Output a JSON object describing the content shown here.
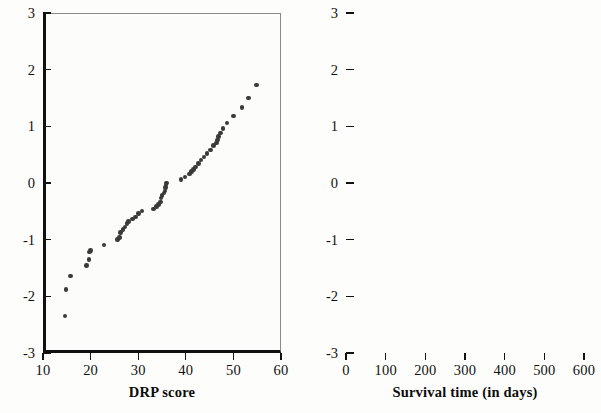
{
  "figure": {
    "background_color": "#fdfdfc",
    "point_color": "#3a3a3a",
    "axis_color": "#111111",
    "panel_count": 2
  },
  "chart_data": [
    {
      "type": "scatter",
      "title": "",
      "xlabel": "DRP score",
      "ylabel": "",
      "xlim": [
        10,
        60
      ],
      "ylim": [
        -3,
        3
      ],
      "xticks": [
        10,
        20,
        30,
        40,
        50,
        60
      ],
      "xticklabels": [
        "10",
        "20",
        "30",
        "40",
        "50",
        "60"
      ],
      "yticks": [
        -3,
        -2,
        -1,
        0,
        1,
        2,
        3
      ],
      "yticklabels": [
        "-3",
        "-2",
        "-1",
        "0",
        "1",
        "2",
        "3"
      ],
      "grid": false,
      "legend": "none",
      "x": [
        14.0,
        14.2,
        15.2,
        18.5,
        19.0,
        19.2,
        19.4,
        22.2,
        25.0,
        25.4,
        25.6,
        26.2,
        26.6,
        27.0,
        27.3,
        28.2,
        28.8,
        29.4,
        30.2,
        32.6,
        33.2,
        33.6,
        34.0,
        34.2,
        34.4,
        34.8,
        35.0,
        35.1,
        35.2,
        35.3,
        38.4,
        39.2,
        40.2,
        40.6,
        41.0,
        41.4,
        42.0,
        42.6,
        43.2,
        43.8,
        44.6,
        45.2,
        45.8,
        46.0,
        46.2,
        46.6,
        47.2,
        48.0,
        49.4,
        51.2,
        52.6,
        54.2
      ],
      "y": [
        -2.33,
        -1.86,
        -1.62,
        -1.44,
        -1.33,
        -1.2,
        -1.17,
        -1.08,
        -0.98,
        -0.94,
        -0.86,
        -0.8,
        -0.76,
        -0.7,
        -0.66,
        -0.62,
        -0.58,
        -0.52,
        -0.48,
        -0.44,
        -0.4,
        -0.36,
        -0.32,
        -0.25,
        -0.2,
        -0.16,
        -0.12,
        -0.06,
        -0.02,
        0.02,
        0.08,
        0.12,
        0.18,
        0.22,
        0.26,
        0.3,
        0.36,
        0.42,
        0.48,
        0.54,
        0.6,
        0.68,
        0.72,
        0.78,
        0.84,
        0.9,
        0.98,
        1.08,
        1.2,
        1.35,
        1.52,
        1.75,
        2.21
      ]
    },
    {
      "type": "scatter",
      "title": "",
      "xlabel": "Survival time (in days)",
      "ylabel": "",
      "xlim": [
        0,
        600
      ],
      "ylim": [
        -3,
        3
      ],
      "xticks": [
        0,
        100,
        200,
        300,
        400,
        500,
        600
      ],
      "xticklabels": [
        "0",
        "100",
        "200",
        "300",
        "400",
        "500",
        "600"
      ],
      "yticks": [
        -3,
        -2,
        -1,
        0,
        1,
        2,
        3
      ],
      "yticklabels": [
        "-3",
        "-2",
        "-1",
        "0",
        "1",
        "2",
        "3"
      ],
      "grid": false,
      "legend": "none",
      "x": [
        45,
        47,
        53,
        56,
        58,
        60,
        62,
        66,
        68,
        69,
        70,
        72,
        74,
        75,
        76,
        77,
        78,
        79,
        80,
        81,
        82,
        83,
        84,
        85,
        86,
        87,
        88,
        89,
        90,
        91,
        92,
        93,
        94,
        96,
        98,
        100,
        101,
        103,
        105,
        107,
        109,
        111,
        113,
        116,
        119,
        122,
        125,
        128,
        131,
        134,
        138,
        142,
        146,
        150,
        155,
        160,
        166,
        172,
        178,
        185,
        192,
        200,
        210,
        218,
        222,
        248,
        255,
        336,
        388,
        410,
        520,
        530,
        600
      ],
      "y": [
        -2.47,
        -2.05,
        -1.85,
        -1.72,
        -1.62,
        -1.54,
        -1.41,
        -1.36,
        -1.3,
        -1.24,
        -1.18,
        -1.12,
        -1.06,
        -1.0,
        -0.95,
        -0.9,
        -0.86,
        -0.82,
        -0.78,
        -0.74,
        -0.7,
        -0.66,
        -0.62,
        -0.58,
        -0.54,
        -0.5,
        -0.46,
        -0.42,
        -0.38,
        -0.34,
        -0.3,
        -0.26,
        -0.22,
        -0.18,
        -0.14,
        -0.1,
        -0.06,
        -0.02,
        0.02,
        0.06,
        0.1,
        0.14,
        0.18,
        0.22,
        0.26,
        0.31,
        0.36,
        0.41,
        0.46,
        0.5,
        0.55,
        0.6,
        0.64,
        0.68,
        0.72,
        0.76,
        0.82,
        0.86,
        0.9,
        0.95,
        1.0,
        1.05,
        1.1,
        1.13,
        1.15,
        1.22,
        1.3,
        1.37,
        1.47,
        1.61,
        1.74,
        1.98,
        2.37
      ]
    }
  ]
}
